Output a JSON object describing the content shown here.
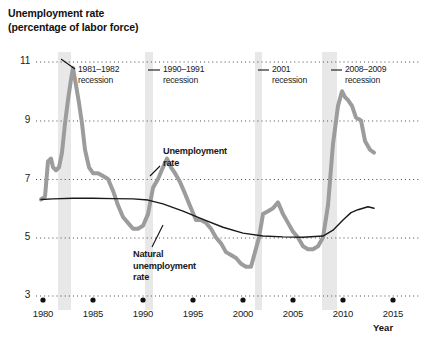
{
  "chart_data": {
    "type": "line",
    "title_line1": "Unemployment rate",
    "title_line2": "(percentage of labor force)",
    "xlabel": "Year",
    "ylabel": "",
    "xlim": [
      1979,
      2015.5
    ],
    "ylim": [
      3,
      11.6
    ],
    "grid": "horizontal-dotted",
    "legend_position": "inline-annotations",
    "yticks": [
      3,
      5,
      7,
      9,
      11
    ],
    "ytick_labels": [
      "3",
      "5",
      "7",
      "9",
      "11"
    ],
    "xticks": [
      1980,
      1985,
      1990,
      1995,
      2000,
      2005,
      2010,
      2015
    ],
    "xtick_labels": [
      "1980",
      "1985",
      "1990",
      "1995",
      "2000",
      "2005",
      "2010",
      "2015"
    ],
    "colors": {
      "unemployment_line": "#9c9c9c",
      "natural_rate_line": "#1a1a1a",
      "recession_band": "#e8e8e8",
      "gridline": "#4a4a4a",
      "text": "#1a1a1a"
    },
    "series": [
      {
        "name": "Unemployment rate",
        "color": "#9c9c9c",
        "linewidth": 4,
        "x": [
          1979.8,
          1980.2,
          1980.5,
          1980.8,
          1981.0,
          1981.3,
          1981.6,
          1981.9,
          1982.2,
          1982.5,
          1982.8,
          1983.0,
          1983.3,
          1983.6,
          1983.9,
          1984.2,
          1984.6,
          1985.0,
          1985.5,
          1986.0,
          1986.5,
          1987.0,
          1987.5,
          1988.0,
          1988.5,
          1989.0,
          1989.5,
          1990.0,
          1990.5,
          1991.0,
          1991.5,
          1992.0,
          1992.4,
          1992.8,
          1993.2,
          1993.7,
          1994.2,
          1994.8,
          1995.3,
          1995.8,
          1996.3,
          1996.8,
          1997.3,
          1997.8,
          1998.3,
          1998.8,
          1999.3,
          1999.8,
          2000.3,
          2000.8,
          2001.2,
          2001.6,
          2002.0,
          2002.5,
          2003.0,
          2003.5,
          2004.0,
          2004.5,
          2005.0,
          2005.5,
          2006.0,
          2006.5,
          2007.0,
          2007.5,
          2008.0,
          2008.5,
          2009.0,
          2009.5,
          2009.9,
          2010.2,
          2010.5,
          2010.9,
          2011.3,
          2011.8,
          2012.2,
          2012.7,
          2013.1
        ],
        "y": [
          6.3,
          6.4,
          7.6,
          7.7,
          7.4,
          7.3,
          7.4,
          7.9,
          8.9,
          9.7,
          10.4,
          10.8,
          10.2,
          9.6,
          8.9,
          8.0,
          7.4,
          7.2,
          7.2,
          7.1,
          7.0,
          6.6,
          6.1,
          5.7,
          5.5,
          5.3,
          5.3,
          5.4,
          5.8,
          6.7,
          7.0,
          7.4,
          7.7,
          7.4,
          7.2,
          6.9,
          6.5,
          6.0,
          5.6,
          5.6,
          5.5,
          5.3,
          5.0,
          4.8,
          4.5,
          4.4,
          4.3,
          4.1,
          4.0,
          4.0,
          4.5,
          5.0,
          5.8,
          5.9,
          6.0,
          6.2,
          5.8,
          5.5,
          5.2,
          5.0,
          4.7,
          4.6,
          4.6,
          4.7,
          5.0,
          6.1,
          8.2,
          9.5,
          10.0,
          9.8,
          9.7,
          9.5,
          9.1,
          9.0,
          8.3,
          8.0,
          7.9
        ]
      },
      {
        "name": "Natural unemployment rate",
        "color": "#1a1a1a",
        "linewidth": 1.4,
        "x": [
          1979.8,
          1981,
          1983,
          1985,
          1987,
          1989,
          1990.5,
          1992,
          1994,
          1996,
          1998,
          2000,
          2002,
          2004,
          2006,
          2008,
          2009,
          2010,
          2010.8,
          2011.5,
          2012,
          2012.5,
          2013.1
        ],
        "y": [
          6.3,
          6.32,
          6.34,
          6.34,
          6.33,
          6.32,
          6.28,
          6.15,
          5.9,
          5.62,
          5.35,
          5.15,
          5.05,
          5.02,
          5.01,
          5.05,
          5.25,
          5.6,
          5.85,
          5.95,
          6.0,
          6.05,
          6.0
        ]
      }
    ],
    "recession_bands": [
      {
        "label": "1981–1982 recession",
        "start": 1981.5,
        "end": 1982.8
      },
      {
        "label": "1990–1991 recession",
        "start": 1990.2,
        "end": 1991.0
      },
      {
        "label": "2001 recession",
        "start": 2001.2,
        "end": 2001.9
      },
      {
        "label": "2008–2009 recession",
        "start": 2007.9,
        "end": 2009.4
      }
    ],
    "annotations": [
      {
        "name": "recession-1981-1982",
        "text": "1981–1982\nrecession",
        "line1": "1981–1982",
        "line2": "recession"
      },
      {
        "name": "recession-1990-1991",
        "text": "1990–1991\nrecession",
        "line1": "1990–1991",
        "line2": "recession"
      },
      {
        "name": "recession-2001",
        "text": "2001\nrecession",
        "line1": "2001",
        "line2": "recession"
      },
      {
        "name": "recession-2008-2009",
        "text": "2008–2009\nrecession",
        "line1": "2008–2009",
        "line2": "recession"
      },
      {
        "name": "unemployment-rate-label",
        "text": "Unemployment\nrate",
        "line1": "Unemployment",
        "line2": "rate"
      },
      {
        "name": "natural-rate-label",
        "text": "Natural\nunemployment\nrate",
        "line1": "Natural",
        "line2": "unemployment",
        "line3": "rate"
      }
    ]
  }
}
